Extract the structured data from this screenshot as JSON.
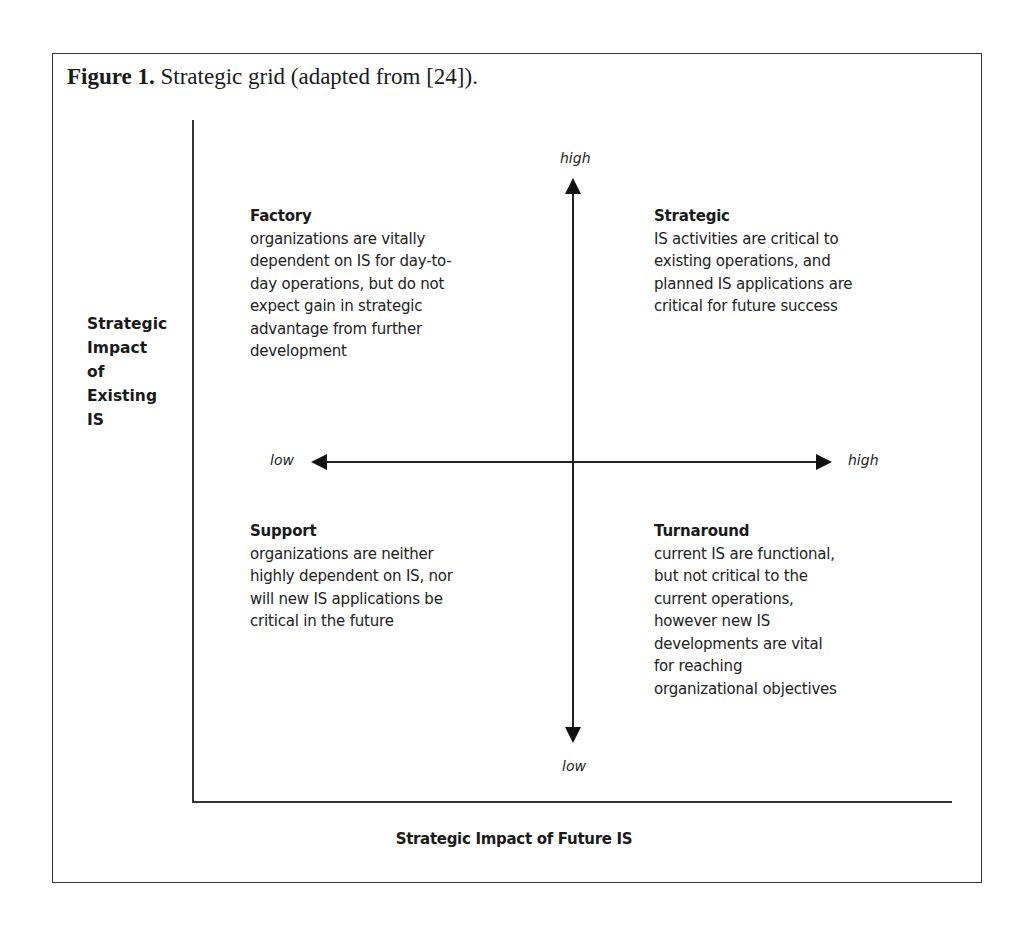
{
  "figure": {
    "caption_label": "Figure 1.",
    "caption_text": " Strategic grid (adapted from [24])."
  },
  "axes": {
    "y_title": "Strategic\nImpact\nof\nExisting\nIS",
    "x_title": "Strategic Impact of Future IS",
    "vertical_high": "high",
    "vertical_low": "low",
    "horizontal_low": "low",
    "horizontal_high": "high"
  },
  "quadrants": [
    {
      "position": "top-left",
      "title": "Factory",
      "description": "organizations are vitally\ndependent on IS for day-to-\nday operations, but do not\nexpect gain in strategic\nadvantage from further\ndevelopment"
    },
    {
      "position": "top-right",
      "title": "Strategic",
      "description": "IS activities are critical to\nexisting operations, and\nplanned IS applications are\ncritical for future success"
    },
    {
      "position": "bottom-left",
      "title": "Support",
      "description": "organizations are neither\nhighly dependent on IS, nor\nwill new IS applications be\ncritical in the future"
    },
    {
      "position": "bottom-right",
      "title": "Turnaround",
      "description": "current IS are functional,\nbut not critical to the\ncurrent operations,\nhowever new IS\ndevelopments are vital\nfor reaching\norganizational objectives"
    }
  ],
  "colors": {
    "ink": "#1c1c1c",
    "background": "#ffffff",
    "border": "#333333"
  }
}
